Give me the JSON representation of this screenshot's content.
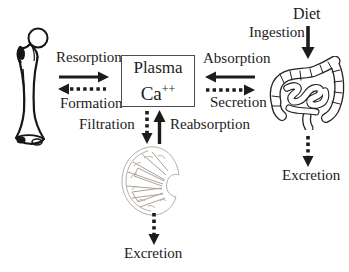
{
  "diagram": {
    "center_box": {
      "line1": "Plasma",
      "element": "Ca",
      "charge": "++"
    },
    "bone_exchange": {
      "to_plasma": "Resorption",
      "from_plasma": "Formation"
    },
    "gut_exchange": {
      "to_plasma": "Absorption",
      "from_plasma": "Secretion"
    },
    "gut_input": {
      "source": "Diet",
      "process": "Ingestion"
    },
    "gut_output": {
      "process": "Excretion"
    },
    "kidney_exchange": {
      "from_plasma": "Filtration",
      "to_plasma": "Reabsorption"
    },
    "kidney_output": {
      "process": "Excretion"
    },
    "icons": {
      "bone": "bone-icon",
      "intestine": "intestine-icon",
      "kidney": "kidney-icon"
    },
    "colors": {
      "ink": "#1c1c1c",
      "background": "#ffffff",
      "box_border": "#4d4d4d",
      "kidney_sketch": "#b6afa7"
    }
  }
}
